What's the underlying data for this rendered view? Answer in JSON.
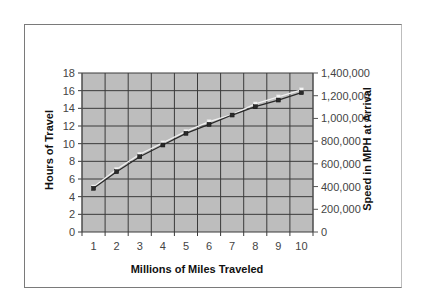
{
  "chart_data": {
    "type": "line",
    "title": "",
    "xlabel": "Millions of Miles Traveled",
    "ylabel": "Hours of Travel",
    "y2label": "Speed in MPH at Arrival",
    "categories": [
      "1",
      "2",
      "3",
      "4",
      "5",
      "6",
      "7",
      "8",
      "9",
      "10"
    ],
    "x": [
      1,
      2,
      3,
      4,
      5,
      6,
      7,
      8,
      9,
      10
    ],
    "ylim": [
      0,
      18
    ],
    "y2lim": [
      0,
      1400000
    ],
    "yticks": [
      "0",
      "2",
      "4",
      "6",
      "8",
      "10",
      "12",
      "14",
      "16",
      "18"
    ],
    "y2ticks": [
      "0",
      "200,000",
      "400,000",
      "600,000",
      "800,000",
      "1,000,000",
      "1,200,000",
      "1,400,000"
    ],
    "grid": true,
    "legend": null,
    "series": [
      {
        "name": "Hours of Travel",
        "axis": "left",
        "color": "#e6e6e6",
        "marker": "square-light",
        "values": [
          5.1,
          7.1,
          8.8,
          10.1,
          11.4,
          12.5,
          13.3,
          14.5,
          15.3,
          16.1
        ]
      },
      {
        "name": "Speed in MPH at Arrival",
        "axis": "right",
        "color": "#333333",
        "marker": "square-dark",
        "values": [
          385000,
          531000,
          663000,
          766000,
          869000,
          948000,
          1030000,
          1103000,
          1162000,
          1227000
        ]
      }
    ]
  },
  "colors": {
    "plot_background": "#bdbdbd",
    "gridline": "#3a3a3a",
    "frame": "#7a7a7a"
  }
}
